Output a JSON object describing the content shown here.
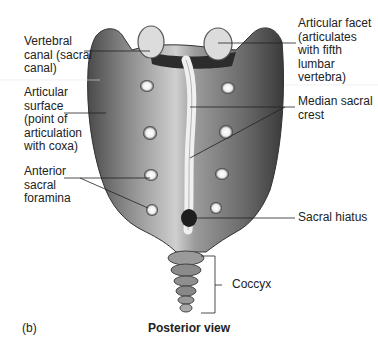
{
  "figure": {
    "panel_label": "(b)",
    "view_title": "Posterior view"
  },
  "labels": {
    "vertebral_canal": "Vertebral\ncanal (sacral\ncanal)",
    "articular_facet": "Articular facet\n(articulates\nwith fifth\nlumbar\nvertebra)",
    "articular_surface": "Articular\nsurface\n(point of\narticulation\nwith coxa)",
    "median_sacral_crest": "Median sacral\ncrest",
    "anterior_sacral_foramina": "Anterior\nsacral\nforamina",
    "sacral_hiatus": "Sacral hiatus",
    "coccyx": "Coccyx"
  },
  "colors": {
    "bone_dark": "#3a3a3a",
    "bone_mid": "#7a7a7a",
    "bone_light": "#d8d8d8",
    "leader_line": "#222222",
    "background": "#ffffff"
  }
}
